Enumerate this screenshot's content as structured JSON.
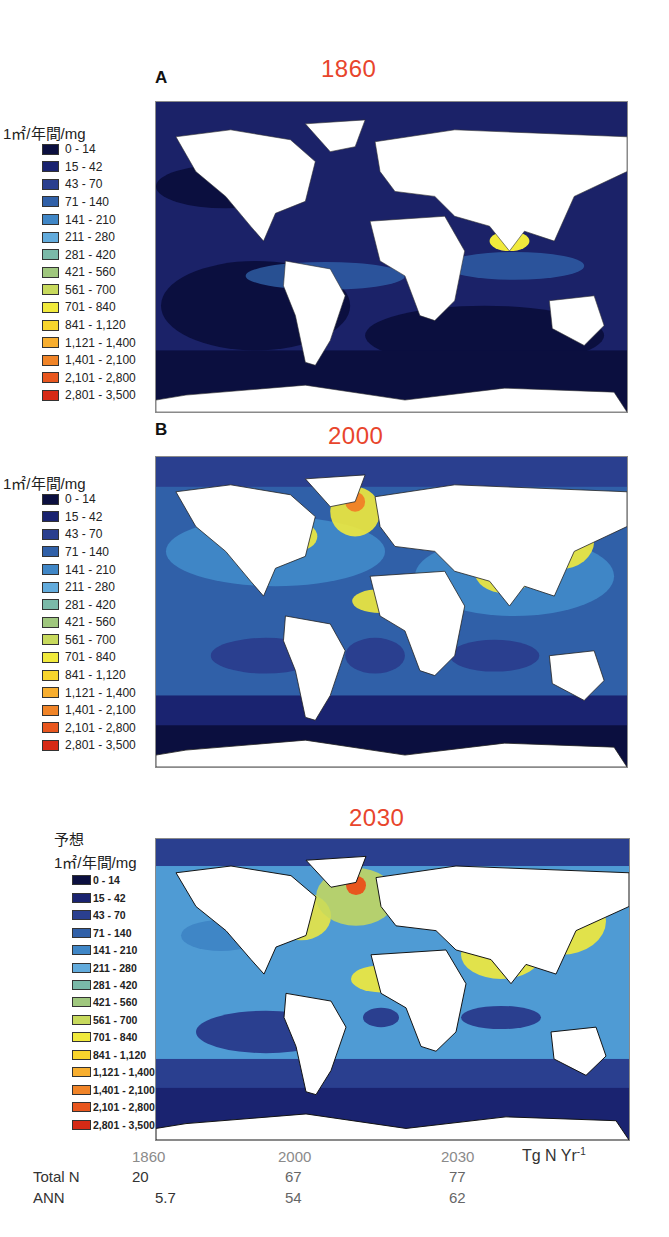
{
  "unit_label": "1㎡/年間/mg",
  "projection_label": "予想",
  "panels": [
    {
      "letter": "A",
      "year": "1860",
      "key": "p1860"
    },
    {
      "letter": "B",
      "year": "2000",
      "key": "p2000"
    },
    {
      "letter": "",
      "year": "2030",
      "key": "p2030"
    }
  ],
  "legend": {
    "items": [
      {
        "label": "0 - 14",
        "color": "#0b0f3f"
      },
      {
        "label": "15 - 42",
        "color": "#1a2370"
      },
      {
        "label": "43 - 70",
        "color": "#2a3f8f"
      },
      {
        "label": "71 - 140",
        "color": "#3060a8"
      },
      {
        "label": "141 - 210",
        "color": "#3f86c6"
      },
      {
        "label": "211 - 280",
        "color": "#62abdc"
      },
      {
        "label": "281 - 420",
        "color": "#7ab9a8"
      },
      {
        "label": "421 - 560",
        "color": "#9fc77e"
      },
      {
        "label": "561 - 700",
        "color": "#c7d95c"
      },
      {
        "label": "701 - 840",
        "color": "#f1ea3c"
      },
      {
        "label": "841 - 1,120",
        "color": "#f8d52d"
      },
      {
        "label": "1,121 - 1,400",
        "color": "#f7ae2f"
      },
      {
        "label": "1,401 - 2,100",
        "color": "#f08428"
      },
      {
        "label": "2,101 - 2,800",
        "color": "#e8561e"
      },
      {
        "label": "2,801 - 3,500",
        "color": "#d62a16"
      }
    ]
  },
  "summary": {
    "unit": "Tg N Yr",
    "unit_sup": "-1",
    "years": [
      "1860",
      "2000",
      "2030"
    ],
    "rows": [
      {
        "label": "Total N",
        "values": [
          "20",
          "67",
          "77"
        ]
      },
      {
        "label": "ANN",
        "values": [
          "5.7",
          "54",
          "62"
        ]
      }
    ]
  },
  "chart_data": {
    "type": "heatmap",
    "panels": [
      "1860",
      "2000",
      "2030 (予想 / projected)"
    ],
    "legend_unit": "1㎡/年間/mg",
    "legend_bins": [
      "0 - 14",
      "15 - 42",
      "43 - 70",
      "71 - 140",
      "141 - 210",
      "211 - 280",
      "281 - 420",
      "421 - 560",
      "561 - 700",
      "701 - 840",
      "841 - 1,120",
      "1,121 - 1,400",
      "1,401 - 2,100",
      "2,101 - 2,800",
      "2,801 - 3,500"
    ],
    "table": {
      "unit": "Tg N Yr-1",
      "columns": [
        "1860",
        "2000",
        "2030"
      ],
      "series": [
        {
          "name": "Total N",
          "values": [
            20,
            67,
            77
          ]
        },
        {
          "name": "ANN",
          "values": [
            5.7,
            54,
            62
          ]
        }
      ]
    }
  }
}
